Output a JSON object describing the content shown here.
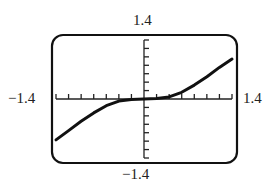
{
  "chart_data": {
    "type": "line",
    "title": "",
    "xlabel": "",
    "ylabel": "",
    "xlim": [
      -1.4,
      1.4
    ],
    "ylim": [
      -1.4,
      1.4
    ],
    "x_tick_step": 0.2,
    "y_tick_step": 0.2,
    "grid": false,
    "legend": null,
    "window_labels": {
      "y_max": "1.4",
      "y_min": "−1.4",
      "x_min": "−1.4",
      "x_max": "1.4"
    },
    "series": [
      {
        "name": "f(x)",
        "x": [
          -1.4,
          -1.2,
          -1.0,
          -0.8,
          -0.6,
          -0.4,
          -0.2,
          0.0,
          0.2,
          0.4,
          0.6,
          0.8,
          1.0,
          1.2,
          1.4
        ],
        "y": [
          -0.97,
          -0.75,
          -0.53,
          -0.33,
          -0.16,
          -0.05,
          -0.01,
          0.0,
          0.01,
          0.05,
          0.16,
          0.33,
          0.53,
          0.75,
          0.95
        ]
      }
    ]
  },
  "labels": {
    "top": "1.4",
    "bottom": "−1.4",
    "left": "−1.4",
    "right": "1.4"
  },
  "colors": {
    "frame": "#111111",
    "curve": "#111111",
    "axes": "#222222"
  }
}
